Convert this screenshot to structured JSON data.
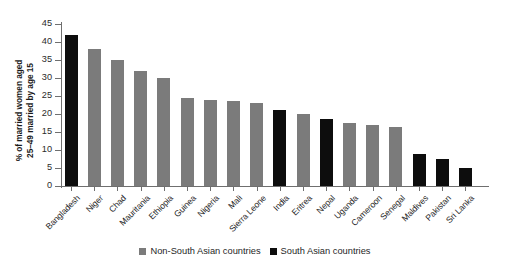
{
  "chart_data": {
    "type": "bar",
    "title": "",
    "xlabel": "",
    "ylabel": "% of married women aged\n25–49 married by age 15",
    "ylim": [
      0,
      45
    ],
    "ytick_step": 5,
    "yticks": [
      "0",
      "5",
      "10",
      "15",
      "20",
      "25",
      "30",
      "35",
      "40",
      "45"
    ],
    "grid": false,
    "legend_position": "bottom-center",
    "categories": [
      "Bangladesh",
      "Niger",
      "Chad",
      "Mauritania",
      "Ethiopia",
      "Guinea",
      "Nigeria",
      "Mali",
      "Sierra Leone",
      "India",
      "Eritrea",
      "Nepal",
      "Uganda",
      "Cameroon",
      "Senegal",
      "Maldives",
      "Pakistan",
      "Sri Lanka"
    ],
    "values": [
      42,
      38,
      35,
      32,
      30,
      24.5,
      24,
      23.5,
      23,
      21,
      20,
      18.5,
      17.5,
      17,
      16.5,
      9,
      7.5,
      5
    ],
    "groups": [
      "south-asian",
      "non-south-asian",
      "non-south-asian",
      "non-south-asian",
      "non-south-asian",
      "non-south-asian",
      "non-south-asian",
      "non-south-asian",
      "non-south-asian",
      "south-asian",
      "non-south-asian",
      "south-asian",
      "non-south-asian",
      "non-south-asian",
      "non-south-asian",
      "south-asian",
      "south-asian",
      "south-asian"
    ],
    "series": [
      {
        "name": "Non-South Asian countries",
        "color": "#7b7b7b"
      },
      {
        "name": "South Asian countries",
        "color": "#0d0d0d"
      }
    ]
  },
  "legend": {
    "items": [
      {
        "label": "Non-South Asian countries",
        "color": "#7b7b7b"
      },
      {
        "label": "South Asian countries",
        "color": "#0d0d0d"
      }
    ]
  },
  "colors": {
    "non_south_asian": "#7b7b7b",
    "south_asian": "#0d0d0d",
    "axis": "#6f6f6f",
    "background": "#ffffff",
    "text": "#1f1f1f"
  }
}
